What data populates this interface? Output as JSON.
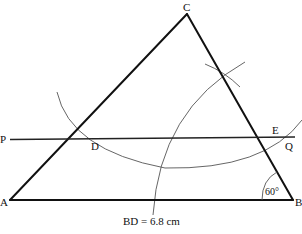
{
  "diagram": {
    "points": {
      "A": {
        "label": "A",
        "x": 10,
        "y": 200
      },
      "B": {
        "label": "B",
        "x": 293,
        "y": 200
      },
      "C": {
        "label": "C",
        "x": 187,
        "y": 14
      },
      "D": {
        "label": "D",
        "x": 95,
        "y": 139
      },
      "E": {
        "label": "E",
        "x": 278,
        "y": 139
      },
      "P": {
        "label": "P",
        "x": 10,
        "y": 139
      },
      "Q": {
        "label": "Q",
        "x": 294,
        "y": 139
      }
    },
    "angle_label": "60°",
    "measurement": "BD = 6.8 cm",
    "colors": {
      "line": "#111111",
      "arc": "#555555",
      "background": "#ffffff"
    }
  }
}
